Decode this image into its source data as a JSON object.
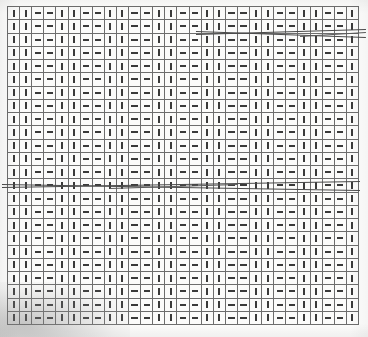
{
  "document": {
    "kind": "scanned-grid-pattern",
    "caption": "",
    "background_color": "#fdfdfc"
  },
  "lattice": {
    "left": 7,
    "top": 6,
    "width": 352,
    "height": 319,
    "columns": 29,
    "rows": 24,
    "gridline_color": "#6d6d6d",
    "cell_color": "#fbfbfa",
    "glyph_color": "#3a3a3a",
    "gridline_width": 1,
    "pattern_period": 4,
    "pattern_sequence": [
      "vbar",
      "vbar",
      "dash",
      "dash"
    ],
    "glyph_names": {
      "vbar": "vertical-bar-glyph",
      "dash": "horizontal-dash-glyph"
    }
  },
  "sweep_lines": [
    {
      "name": "sweep-line-upper-a",
      "x1": 196,
      "y1": 31,
      "x2": 366,
      "y2": 37,
      "color": "#4a4a4a"
    },
    {
      "name": "sweep-line-upper-b",
      "x1": 196,
      "y1": 34,
      "x2": 366,
      "y2": 29,
      "color": "#4a4a4a"
    },
    {
      "name": "sweep-line-upper-c",
      "x1": 300,
      "y1": 36,
      "x2": 366,
      "y2": 32,
      "color": "#5a5a5a"
    },
    {
      "name": "sweep-line-mid-a",
      "x1": 2,
      "y1": 184,
      "x2": 360,
      "y2": 190,
      "color": "#4a4a4a"
    },
    {
      "name": "sweep-line-mid-b",
      "x1": 2,
      "y1": 187,
      "x2": 360,
      "y2": 181,
      "color": "#4a4a4a"
    },
    {
      "name": "sweep-line-mid-c",
      "x1": 110,
      "y1": 188,
      "x2": 238,
      "y2": 184,
      "color": "#5a5a5a"
    }
  ],
  "blur_artifact": {
    "name": "corner-blur-artifact",
    "left": 0,
    "top": 282,
    "width": 130,
    "height": 55
  }
}
